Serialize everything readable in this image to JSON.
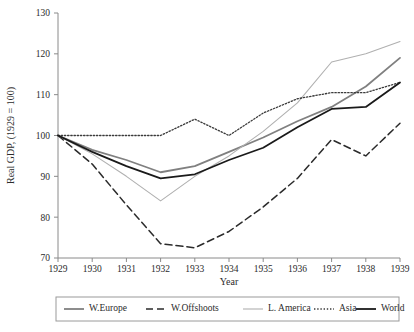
{
  "chart_data": {
    "type": "line",
    "title": "",
    "xlabel": "Year",
    "ylabel": "Real GDP, (1929 = 100)",
    "x": [
      1929,
      1930,
      1931,
      1932,
      1933,
      1934,
      1935,
      1936,
      1937,
      1938,
      1939
    ],
    "xticklabels": [
      "1929",
      "1930",
      "1931",
      "1932",
      "1933",
      "1934",
      "1935",
      "1936",
      "1937",
      "1938",
      "1939"
    ],
    "yticklabels": [
      "70",
      "80",
      "90",
      "100",
      "110",
      "120",
      "130"
    ],
    "yticks": [
      70,
      80,
      90,
      100,
      110,
      120,
      130
    ],
    "xlim": [
      1929,
      1939
    ],
    "ylim": [
      70,
      130
    ],
    "grid": false,
    "legend_position": "bottom",
    "series": [
      {
        "name": "W.Europe",
        "style": "solid",
        "color": "#808080",
        "width": 1.8,
        "values": [
          100,
          96.5,
          94,
          91,
          92.5,
          96,
          99.5,
          103.5,
          107,
          112,
          119
        ]
      },
      {
        "name": "W.Offshoots",
        "style": "dashed",
        "color": "#2b2b2b",
        "width": 1.5,
        "values": [
          100,
          93,
          83,
          73.5,
          72.5,
          76.5,
          82.5,
          89.5,
          99,
          95,
          103
        ]
      },
      {
        "name": "L. America",
        "style": "thin",
        "color": "#b0b0b0",
        "width": 1.1,
        "values": [
          100,
          95.5,
          90,
          84,
          90,
          95,
          101,
          108,
          118,
          120,
          123
        ]
      },
      {
        "name": "Asia",
        "style": "dotted",
        "color": "#3a3a3a",
        "width": 1.3,
        "values": [
          100,
          100,
          100,
          100,
          104,
          100,
          105.5,
          109,
          110.5,
          110.5,
          113
        ]
      },
      {
        "name": "World",
        "style": "solid",
        "color": "#1a1a1a",
        "width": 1.8,
        "values": [
          100,
          96,
          92.5,
          89.5,
          90.5,
          94,
          97,
          102,
          106.5,
          107,
          113
        ]
      }
    ]
  },
  "legend": {
    "items": [
      {
        "label": "W.Europe"
      },
      {
        "label": "W.Offshoots"
      },
      {
        "label": "L. America"
      },
      {
        "label": "Asia"
      },
      {
        "label": "World"
      }
    ]
  }
}
